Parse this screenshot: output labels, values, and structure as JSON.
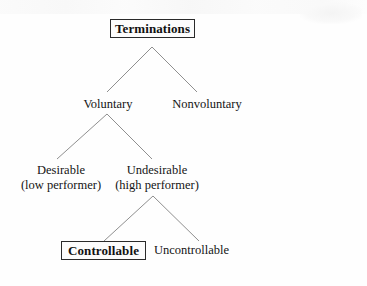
{
  "diagram": {
    "type": "tree",
    "background_color": "#fefefe",
    "line_color": "#8f8f8f",
    "box_fill_color": "#fcfcfc",
    "box_border_color": "#2a2a2a",
    "box_shadow_color": "#0a0a0a",
    "text_color": "#141414",
    "nodes": {
      "root": {
        "label": "Terminations",
        "style": "boxed-shadow",
        "level": 0
      },
      "voluntary": {
        "label": "Voluntary",
        "style": "plain",
        "level": 1
      },
      "nonvoluntary": {
        "label": "Nonvoluntary",
        "style": "plain",
        "level": 1
      },
      "desirable": {
        "line1": "Desirable",
        "line2": "(low performer)",
        "style": "plain",
        "level": 2
      },
      "undesirable": {
        "line1": "Undesirable",
        "line2": "(high performer)",
        "style": "plain",
        "level": 2
      },
      "controllable": {
        "label": "Controllable",
        "style": "boxed-shadow",
        "level": 3
      },
      "uncontrollable": {
        "label": "Uncontrollable",
        "style": "plain",
        "level": 3
      }
    },
    "edges": [
      {
        "from": "root",
        "to": "voluntary"
      },
      {
        "from": "root",
        "to": "nonvoluntary"
      },
      {
        "from": "voluntary",
        "to": "desirable"
      },
      {
        "from": "voluntary",
        "to": "undesirable"
      },
      {
        "from": "undesirable",
        "to": "controllable"
      },
      {
        "from": "undesirable",
        "to": "uncontrollable"
      }
    ]
  }
}
